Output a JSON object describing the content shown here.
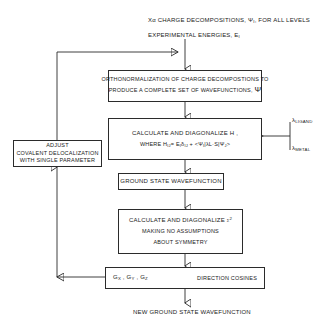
{
  "diagram": {
    "title_text": {
      "line1": "Xα CHARGE DECOMPOSITIONS, Ψ",
      "line1_sub": "I",
      "line1_tail": ", FOR ALL LEVELS",
      "line2": "EXPERIMENTAL ENERGIES, E",
      "line2_sub": "I"
    },
    "nodes": {
      "orthonormalization": {
        "line1": "ORTHONORMALIZATION OF CHARGE DECOMPOSTIONS TO",
        "line2": "PRODUCE A COMPLETE SET OF WAVEFUNCTIONS,",
        "line2_sym": "Ψ"
      },
      "hamiltonian": {
        "line1": "CALCULATE AND DIAGONALIZE H ,",
        "line2_pre": "WHERE H",
        "line2_sub1": "IJ",
        "line2_mid": "= E",
        "line2_sub2": "I",
        "line2_delta": "δ",
        "line2_sub3": "IJ",
        "line2_plus": "+",
        "line2_braket": "<Ψ",
        "line2_sub4": "I",
        "line2_op": "|λL·S|",
        "line2_ket": "Ψ",
        "line2_sub5": "J",
        "line2_end": ">"
      },
      "adjust": {
        "line1": "ADJUST",
        "line2": "COVALENT DELOCALIZATION",
        "line3": "WITH SINGLE PARAMETER"
      },
      "ground_state": {
        "line1": "GROUND STATE WAVEFUNCTION"
      },
      "sigma": {
        "line1_pre": "CALCULATE AND DIAGONALIZE",
        "line1_sym": "σ",
        "line1_sup": "2",
        "line2": "MAKING NO ASSUMPTIONS",
        "line3": "ABOUT SYMMETRY"
      },
      "direction_cosines": {
        "left_g": "G",
        "left_sub_x": "X",
        "left_sub_y": "Y",
        "left_sub_z": "Z",
        "left_label": "Gₓ , Gᵧ , Gᶻ",
        "right_label": "DIRECTION COSINES"
      }
    },
    "inputs": {
      "lambda_ligand_sym": "λ",
      "lambda_ligand_sub": "LIGAND",
      "lambda_metal_sym": "λ",
      "lambda_metal_sub": "METAL"
    },
    "output_text": "NEW GROUND STATE WAVEFUNCTION",
    "colors": {
      "stroke": "#2b2b2b",
      "text": "#1a1a1a",
      "background": "#ffffff"
    }
  }
}
